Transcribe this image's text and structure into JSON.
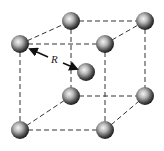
{
  "diagram": {
    "type": "body-centered cubic unit cell",
    "label": "R",
    "colors": {
      "edge": "#333333",
      "sphere_dark": "#1a1a1a",
      "sphere_light": "#f2f2f2",
      "arrow": "#111111"
    },
    "atoms": [
      {
        "id": "back-top-left",
        "x": 71,
        "y": 21
      },
      {
        "id": "back-top-right",
        "x": 145,
        "y": 21
      },
      {
        "id": "front-top-left",
        "x": 20,
        "y": 44
      },
      {
        "id": "front-top-right",
        "x": 105,
        "y": 44
      },
      {
        "id": "body-center",
        "x": 86,
        "y": 72
      },
      {
        "id": "back-bottom-left",
        "x": 71,
        "y": 96
      },
      {
        "id": "back-bottom-right",
        "x": 145,
        "y": 96
      },
      {
        "id": "front-bottom-left",
        "x": 20,
        "y": 130
      },
      {
        "id": "front-bottom-right",
        "x": 105,
        "y": 130
      }
    ]
  }
}
